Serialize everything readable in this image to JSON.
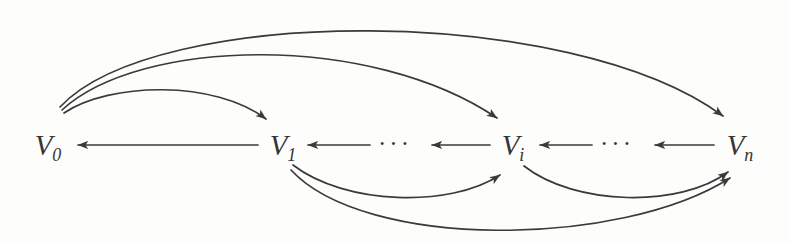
{
  "diagram": {
    "type": "directed-graph",
    "title": "",
    "background_color": "#fdfdfc",
    "ink_color": "#3a3a3a",
    "nodes": [
      {
        "id": "V0",
        "base": "V",
        "subscript": "0",
        "x": 48,
        "y": 145
      },
      {
        "id": "V1",
        "base": "V",
        "subscript": "1",
        "x": 283,
        "y": 145
      },
      {
        "id": "Vi",
        "base": "V",
        "subscript": "i",
        "x": 513,
        "y": 145
      },
      {
        "id": "Vn",
        "base": "V",
        "subscript": "n",
        "x": 740,
        "y": 145
      }
    ],
    "ellipses": [
      {
        "id": "ellipsis-left",
        "text": "···",
        "x": 395,
        "y": 143
      },
      {
        "id": "ellipsis-right",
        "text": "···",
        "x": 617,
        "y": 143
      }
    ],
    "edges": [
      {
        "id": "edge-v1-to-v0",
        "from": "V1",
        "to": "V0",
        "style": "straight",
        "direction": "left"
      },
      {
        "id": "edge-gap-to-v1",
        "from": "ellipsis-left",
        "to": "V1",
        "style": "straight",
        "direction": "left"
      },
      {
        "id": "edge-vi-to-gap",
        "from": "Vi",
        "to": "ellipsis-left",
        "style": "straight",
        "direction": "left"
      },
      {
        "id": "edge-gap2-to-vi",
        "from": "ellipsis-right",
        "to": "Vi",
        "style": "straight",
        "direction": "left"
      },
      {
        "id": "edge-vn-to-gap2",
        "from": "Vn",
        "to": "ellipsis-right",
        "style": "straight",
        "direction": "left"
      },
      {
        "id": "edge-v0-to-v1",
        "from": "V0",
        "to": "V1",
        "style": "arc-above",
        "direction": "right"
      },
      {
        "id": "edge-v0-to-vi",
        "from": "V0",
        "to": "Vi",
        "style": "arc-above",
        "direction": "right"
      },
      {
        "id": "edge-v0-to-vn",
        "from": "V0",
        "to": "Vn",
        "style": "arc-above",
        "direction": "right"
      },
      {
        "id": "edge-v1-to-vi",
        "from": "V1",
        "to": "Vi",
        "style": "arc-below",
        "direction": "right"
      },
      {
        "id": "edge-vi-to-vn",
        "from": "Vi",
        "to": "Vn",
        "style": "arc-below",
        "direction": "right"
      },
      {
        "id": "edge-v1-to-vn",
        "from": "V1",
        "to": "Vn",
        "style": "arc-below",
        "direction": "right"
      }
    ]
  }
}
